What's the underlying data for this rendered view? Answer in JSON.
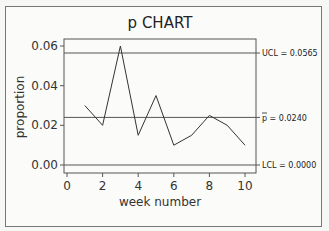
{
  "chart_data": {
    "type": "line",
    "title": "p  CHART",
    "xlabel": "week number",
    "ylabel": "proportion",
    "x": [
      1,
      2,
      3,
      4,
      5,
      6,
      7,
      8,
      9,
      10
    ],
    "series": [
      {
        "name": "proportion",
        "values": [
          0.03,
          0.02,
          0.06,
          0.015,
          0.035,
          0.01,
          0.015,
          0.025,
          0.02,
          0.01
        ]
      }
    ],
    "xticks": [
      "0",
      "2",
      "4",
      "6",
      "8",
      "10"
    ],
    "yticks": [
      "0.00",
      "0.02",
      "0.04",
      "0.06"
    ],
    "xlim": [
      -0.2,
      10.6
    ],
    "ylim": [
      -0.005,
      0.063
    ],
    "grid": false,
    "reference_lines": [
      {
        "name": "UCL",
        "value": 0.0565,
        "label": "UCL = 0.0565"
      },
      {
        "name": "center",
        "value": 0.024,
        "label": "p = 0.0240"
      },
      {
        "name": "LCL",
        "value": 0.0,
        "label": "LCL = 0.0000"
      }
    ]
  },
  "labels": {
    "title": "p  CHART",
    "xlabel": "week number",
    "ylabel": "proportion",
    "ucl": "UCL = 0.0565",
    "center": "p = 0.0240",
    "lcl": "LCL = 0.0000",
    "xt0": "0",
    "xt1": "2",
    "xt2": "4",
    "xt3": "6",
    "xt4": "8",
    "xt5": "10",
    "yt0": "0.00",
    "yt1": "0.02",
    "yt2": "0.04",
    "yt3": "0.06"
  }
}
